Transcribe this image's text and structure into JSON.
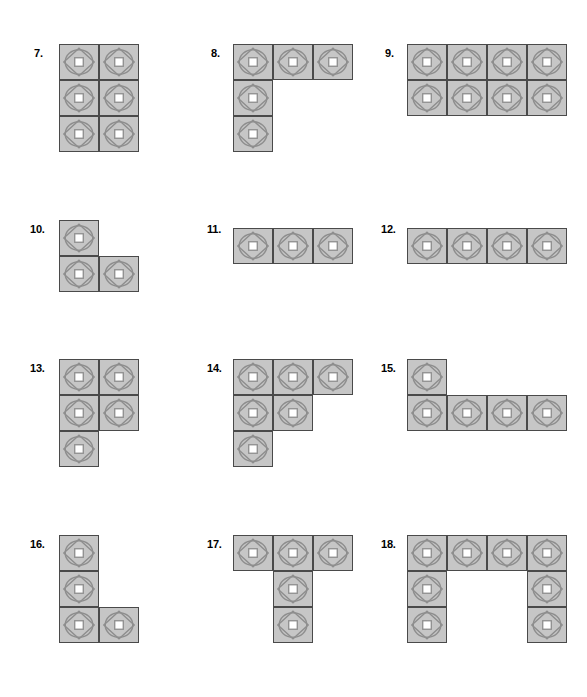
{
  "page": {
    "background_color": "#ffffff",
    "width": 587,
    "height": 697
  },
  "cell_style": {
    "fill_color": "#c6c6c6",
    "border_color": "#4a4a4a",
    "motif_stroke_color": "#8e8e8e",
    "center_square_fill": "#ffffff",
    "cell_width": 40,
    "cell_height": 36,
    "icon_names": [
      "circle-icon",
      "diamond-icon",
      "center-square-icon"
    ]
  },
  "problems": [
    {
      "number": "7.",
      "label_x": 34,
      "label_y": 48,
      "grid_x": 59,
      "grid_y": 44,
      "cols": 2,
      "rows": 3,
      "cells": [
        [
          0,
          0
        ],
        [
          1,
          0
        ],
        [
          0,
          1
        ],
        [
          1,
          1
        ],
        [
          0,
          2
        ],
        [
          1,
          2
        ]
      ],
      "cell_count": 6,
      "shape_name": "rectangle-2x3"
    },
    {
      "number": "8.",
      "label_x": 211,
      "label_y": 48,
      "grid_x": 233,
      "grid_y": 44,
      "cols": 3,
      "rows": 3,
      "cells": [
        [
          0,
          0
        ],
        [
          1,
          0
        ],
        [
          2,
          0
        ],
        [
          0,
          1
        ],
        [
          0,
          2
        ]
      ],
      "cell_count": 5,
      "shape_name": "v-pentomino"
    },
    {
      "number": "9.",
      "label_x": 385,
      "label_y": 48,
      "grid_x": 407,
      "grid_y": 44,
      "cols": 4,
      "rows": 2,
      "cells": [
        [
          0,
          0
        ],
        [
          1,
          0
        ],
        [
          2,
          0
        ],
        [
          3,
          0
        ],
        [
          0,
          1
        ],
        [
          1,
          1
        ],
        [
          2,
          1
        ],
        [
          3,
          1
        ]
      ],
      "cell_count": 8,
      "shape_name": "rectangle-4x2"
    },
    {
      "number": "10.",
      "label_x": 30,
      "label_y": 224,
      "grid_x": 59,
      "grid_y": 220,
      "cols": 2,
      "rows": 2,
      "cells": [
        [
          0,
          0
        ],
        [
          0,
          1
        ],
        [
          1,
          1
        ]
      ],
      "cell_count": 3,
      "shape_name": "l-tromino"
    },
    {
      "number": "11.",
      "label_x": 207,
      "label_y": 224,
      "grid_x": 233,
      "grid_y": 228,
      "cols": 3,
      "rows": 1,
      "cells": [
        [
          0,
          0
        ],
        [
          1,
          0
        ],
        [
          2,
          0
        ]
      ],
      "cell_count": 3,
      "shape_name": "row-3x1"
    },
    {
      "number": "12.",
      "label_x": 381,
      "label_y": 224,
      "grid_x": 407,
      "grid_y": 228,
      "cols": 4,
      "rows": 1,
      "cells": [
        [
          0,
          0
        ],
        [
          1,
          0
        ],
        [
          2,
          0
        ],
        [
          3,
          0
        ]
      ],
      "cell_count": 4,
      "shape_name": "row-4x1"
    },
    {
      "number": "13.",
      "label_x": 30,
      "label_y": 363,
      "grid_x": 59,
      "grid_y": 359,
      "cols": 2,
      "rows": 3,
      "cells": [
        [
          0,
          0
        ],
        [
          1,
          0
        ],
        [
          0,
          1
        ],
        [
          1,
          1
        ],
        [
          0,
          2
        ]
      ],
      "cell_count": 5,
      "shape_name": "p-pentomino"
    },
    {
      "number": "14.",
      "label_x": 207,
      "label_y": 363,
      "grid_x": 233,
      "grid_y": 359,
      "cols": 3,
      "rows": 3,
      "cells": [
        [
          0,
          0
        ],
        [
          1,
          0
        ],
        [
          2,
          0
        ],
        [
          0,
          1
        ],
        [
          1,
          1
        ],
        [
          0,
          2
        ]
      ],
      "cell_count": 6,
      "shape_name": "staircase-hexomino"
    },
    {
      "number": "15.",
      "label_x": 381,
      "label_y": 363,
      "grid_x": 407,
      "grid_y": 359,
      "cols": 4,
      "rows": 2,
      "cells": [
        [
          0,
          0
        ],
        [
          0,
          1
        ],
        [
          1,
          1
        ],
        [
          2,
          1
        ],
        [
          3,
          1
        ]
      ],
      "cell_count": 5,
      "shape_name": "l-pentomino"
    },
    {
      "number": "16.",
      "label_x": 30,
      "label_y": 539,
      "grid_x": 59,
      "grid_y": 535,
      "cols": 2,
      "rows": 3,
      "cells": [
        [
          0,
          0
        ],
        [
          0,
          1
        ],
        [
          0,
          2
        ],
        [
          1,
          2
        ]
      ],
      "cell_count": 4,
      "shape_name": "l-tetromino"
    },
    {
      "number": "17.",
      "label_x": 207,
      "label_y": 539,
      "grid_x": 233,
      "grid_y": 535,
      "cols": 3,
      "rows": 3,
      "cells": [
        [
          0,
          0
        ],
        [
          1,
          0
        ],
        [
          2,
          0
        ],
        [
          1,
          1
        ],
        [
          1,
          2
        ]
      ],
      "cell_count": 5,
      "shape_name": "t-pentomino"
    },
    {
      "number": "18.",
      "label_x": 381,
      "label_y": 539,
      "grid_x": 407,
      "grid_y": 535,
      "cols": 4,
      "rows": 3,
      "cells": [
        [
          0,
          0
        ],
        [
          1,
          0
        ],
        [
          2,
          0
        ],
        [
          3,
          0
        ],
        [
          0,
          1
        ],
        [
          3,
          1
        ],
        [
          0,
          2
        ],
        [
          3,
          2
        ]
      ],
      "cell_count": 8,
      "shape_name": "u-octomino"
    }
  ]
}
